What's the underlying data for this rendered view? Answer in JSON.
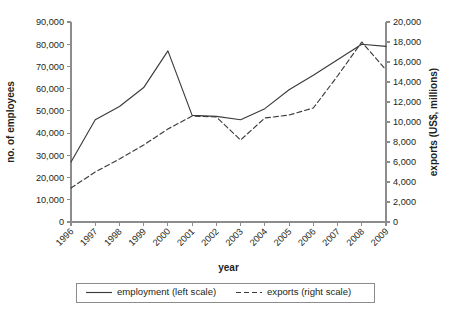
{
  "chart_data": {
    "type": "line",
    "title": "",
    "xlabel": "year",
    "categories": [
      "1996",
      "1997",
      "1998",
      "1999",
      "2000",
      "2001",
      "2002",
      "2003",
      "2004",
      "2005",
      "2006",
      "2007",
      "2008",
      "2009"
    ],
    "grid": false,
    "legend_position": "bottom",
    "axes": {
      "left": {
        "label": "no. of employees",
        "min": 0,
        "max": 90000,
        "step": 10000,
        "ticks": [
          "0",
          "10,000",
          "20,000",
          "30,000",
          "40,000",
          "50,000",
          "60,000",
          "70,000",
          "80,000",
          "90,000"
        ]
      },
      "right": {
        "label": "exports (US$, millions)",
        "min": 0,
        "max": 20000,
        "step": 2000,
        "ticks": [
          "0",
          "2,000",
          "4,000",
          "6,000",
          "8,000",
          "10,000",
          "12,000",
          "14,000",
          "16,000",
          "18,000",
          "20,000"
        ]
      }
    },
    "series": [
      {
        "name": "employment (left scale)",
        "legend_label": "employment (left scale)",
        "axis": "left",
        "style": "solid",
        "color": "#3b3b3b",
        "values": [
          27000,
          46000,
          52000,
          60500,
          77000,
          48000,
          47500,
          46000,
          51000,
          59500,
          66000,
          73000,
          80000,
          79000
        ]
      },
      {
        "name": "exports (right scale)",
        "legend_label": "exports (right scale)",
        "axis": "right",
        "style": "dashed",
        "color": "#3b3b3b",
        "values": [
          3400,
          5000,
          6300,
          7700,
          9300,
          10600,
          10500,
          8200,
          10400,
          10700,
          11400,
          14600,
          18000,
          15200
        ]
      }
    ]
  },
  "legend": {
    "items": [
      {
        "label": "employment (left scale)",
        "style": "solid"
      },
      {
        "label": "exports (right scale)",
        "style": "dashed"
      }
    ]
  }
}
